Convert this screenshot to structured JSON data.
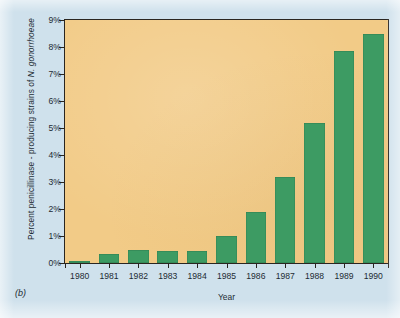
{
  "figure": {
    "panel_label": "(b)",
    "background_color": "#cfe1ec",
    "plot_background_color": "#f2cb87",
    "bar_color": "#3d9b63",
    "axis_color": "#2a2520",
    "text_color": "#1d2b33"
  },
  "axis_titles": {
    "y_prefix": "Percent penicillinase - producing strains of ",
    "y_species": "N. gonorrhoeae",
    "x": "Year"
  },
  "chart_data": {
    "type": "bar",
    "title": "",
    "subtitle": "",
    "xlabel": "Year",
    "ylabel": "Percent penicillinase - producing strains of N. gonorrhoeae",
    "categories": [
      "1980",
      "1981",
      "1982",
      "1983",
      "1984",
      "1985",
      "1986",
      "1987",
      "1988",
      "1989",
      "1990"
    ],
    "values": [
      0.08,
      0.32,
      0.48,
      0.43,
      0.46,
      1.0,
      1.9,
      3.2,
      5.2,
      7.85,
      8.5
    ],
    "value_unit": "%",
    "ylim": [
      0,
      9
    ],
    "ytick_values": [
      0,
      1,
      2,
      3,
      4,
      5,
      6,
      7,
      8,
      9
    ],
    "ytick_labels": [
      "0%",
      "1%",
      "2%",
      "3%",
      "4%",
      "5%",
      "6%",
      "7%",
      "8%",
      "9%"
    ],
    "grid": false,
    "legend": null,
    "legend_position": "none",
    "annotations": [
      "(b)"
    ]
  }
}
